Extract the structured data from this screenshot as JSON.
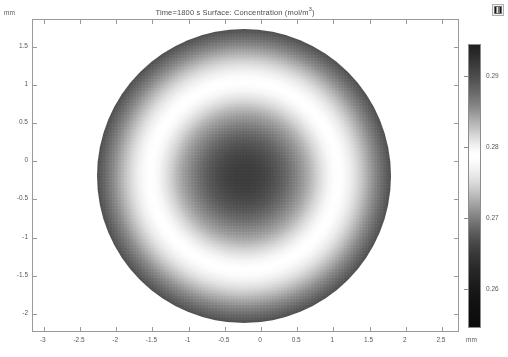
{
  "title": {
    "text": "Time=1800 s   Surface: Concentration (mol/m",
    "superscript": "3",
    "closing": ")",
    "full": "Time=1800 s   Surface: Concentration (mol/m3)"
  },
  "icons": {
    "legend_swatch": "colorbar-legend-icon"
  },
  "axes": {
    "x_unit": "mm",
    "y_unit": "mm",
    "x_ticks": [
      "-3",
      "-2.5",
      "-2",
      "-1.5",
      "-1",
      "-0.5",
      "0",
      "0.5",
      "1",
      "1.5",
      "2",
      "2.5"
    ],
    "y_ticks": [
      "1.5",
      "1",
      "0.5",
      "0",
      "-0.5",
      "-1",
      "-1.5",
      "-2"
    ]
  },
  "colorbar": {
    "ticks": [
      "0.29",
      "0.28",
      "0.27",
      "0.26"
    ],
    "unit": "mol/m3"
  },
  "chart_data": {
    "type": "heatmap",
    "title": "Time=1800 s   Surface: Concentration (mol/m3)",
    "subtitle": "",
    "xlabel": "mm",
    "ylabel": "mm",
    "grid": false,
    "legend_position": "right",
    "xlim": [
      -3.15,
      2.75
    ],
    "ylim": [
      -2.25,
      1.85
    ],
    "x_tick_values": [
      -3,
      -2.5,
      -2,
      -1.5,
      -1,
      -0.5,
      0,
      0.5,
      1,
      1.5,
      2,
      2.5
    ],
    "y_tick_values": [
      1.5,
      1,
      0.5,
      0,
      -0.5,
      -1,
      -1.5,
      -2
    ],
    "colorbar_label": "Concentration (mol/m3)",
    "colorbar_tick_values": [
      0.29,
      0.28,
      0.27,
      0.26
    ],
    "colormap": "grayscale",
    "vmin": 0.2545,
    "vmax": 0.2945,
    "time_s": 1800,
    "geometry": {
      "shape": "disk",
      "center_x": 0.0,
      "center_y": -0.05,
      "radius_mm": 2.05
    },
    "radial_profile": {
      "description": "Concentration vs radius from disk center; bright annulus near r=1.35 mm, dark core and dark rim",
      "r_mm": [
        0.0,
        0.2,
        0.4,
        0.6,
        0.8,
        1.0,
        1.15,
        1.3,
        1.35,
        1.45,
        1.6,
        1.75,
        1.9,
        2.0,
        2.05
      ],
      "concentration": [
        0.2625,
        0.2628,
        0.2638,
        0.2657,
        0.269,
        0.276,
        0.284,
        0.292,
        0.2945,
        0.29,
        0.278,
        0.266,
        0.258,
        0.255,
        0.2545
      ]
    }
  }
}
